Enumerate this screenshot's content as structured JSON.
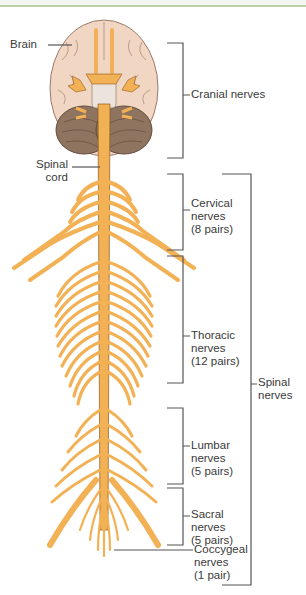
{
  "colors": {
    "nerve": "#f3b155",
    "nerve_outline": "#8a5a1c",
    "brain": "#f2d6c4",
    "cerebellum": "#8f7460",
    "bracket": "#555555",
    "text": "#3a3a3a",
    "top_border": "#bcd0a8"
  },
  "labels": {
    "brain": "Brain",
    "spinal_cord": [
      "Spinal",
      "cord"
    ],
    "cranial": "Cranial nerves",
    "cervical": [
      "Cervical",
      "nerves",
      "(8 pairs)"
    ],
    "thoracic": [
      "Thoracic",
      "nerves",
      "(12 pairs)"
    ],
    "lumbar": [
      "Lumbar",
      "nerves",
      "(5 pairs)"
    ],
    "sacral": [
      "Sacral",
      "nerves",
      "(5 pairs)"
    ],
    "coccygeal": [
      "Coccygeal",
      "nerves",
      "(1 pair)"
    ],
    "spinal_nerves": [
      "Spinal",
      "nerves"
    ]
  },
  "groups": [
    {
      "name": "Cranial nerves",
      "pairs": 12
    },
    {
      "name": "Cervical nerves",
      "pairs": 8
    },
    {
      "name": "Thoracic nerves",
      "pairs": 12
    },
    {
      "name": "Lumbar nerves",
      "pairs": 5
    },
    {
      "name": "Sacral nerves",
      "pairs": 5
    },
    {
      "name": "Coccygeal nerves",
      "pairs": 1
    }
  ]
}
